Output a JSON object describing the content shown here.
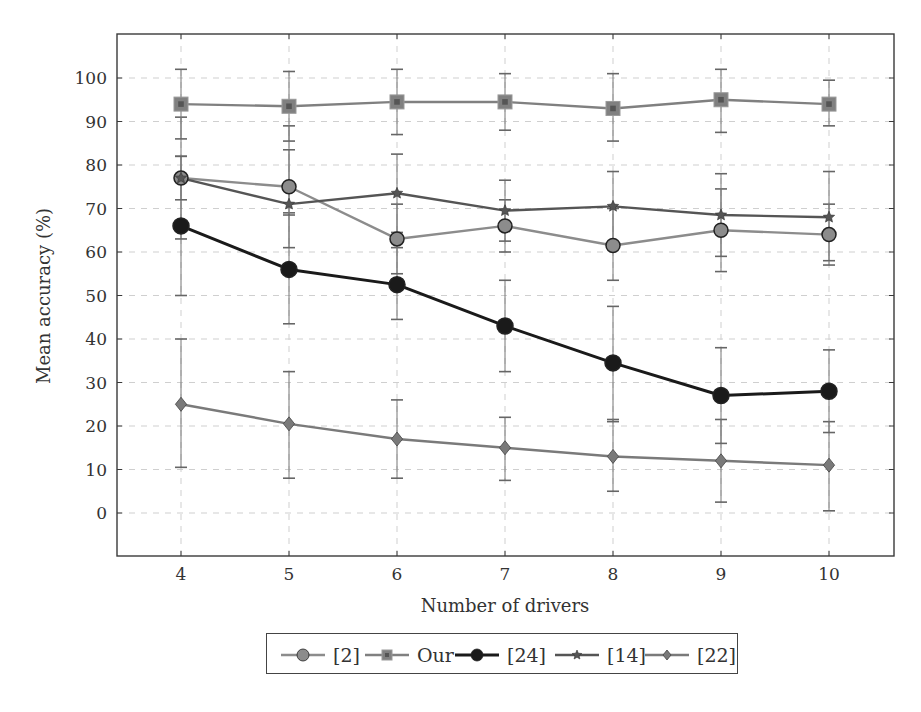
{
  "chart_data": {
    "type": "line",
    "title": "",
    "xlabel": "Number of drivers",
    "ylabel": "Mean accuracy (%)",
    "x": [
      4,
      5,
      6,
      7,
      8,
      9,
      10
    ],
    "xticks": [
      "4",
      "5",
      "6",
      "7",
      "8",
      "9",
      "10"
    ],
    "yticks": [
      "0",
      "10",
      "20",
      "30",
      "40",
      "50",
      "60",
      "70",
      "80",
      "90",
      "100"
    ],
    "xlim": [
      3.4,
      10.6
    ],
    "ylim": [
      -10,
      110
    ],
    "grid": "dashed",
    "legend_position": "bottom",
    "error_bars": true,
    "series": [
      {
        "name": "[2]",
        "marker": "circle",
        "color": "#8c8c8c",
        "line_width": 2.4,
        "values": [
          77,
          75,
          63,
          66,
          61.5,
          65,
          64
        ],
        "err_low": [
          63,
          61,
          55,
          60,
          53.5,
          55.5,
          57
        ],
        "err_high": [
          91,
          89,
          71,
          72,
          70,
          74.5,
          71
        ]
      },
      {
        "name": "Our",
        "marker": "square",
        "color": "#808080",
        "line_width": 2.4,
        "values": [
          94,
          93.5,
          94.5,
          94.5,
          93,
          95,
          94
        ],
        "err_low": [
          86,
          85.5,
          87,
          88,
          85.5,
          87.5,
          89
        ],
        "err_high": [
          102,
          101.5,
          102,
          101,
          101,
          102,
          99.5
        ]
      },
      {
        "name": "[24]",
        "marker": "circle",
        "color": "#1a1a1a",
        "line_width": 3,
        "values": [
          66,
          56,
          52.5,
          43,
          34.5,
          27,
          28
        ],
        "err_low": [
          50,
          43.5,
          44.5,
          32.5,
          21,
          16,
          18.5
        ],
        "err_high": [
          82,
          69,
          61,
          53.5,
          47.5,
          38,
          37.5
        ]
      },
      {
        "name": "[14]",
        "marker": "star",
        "color": "#555555",
        "line_width": 2.4,
        "values": [
          77,
          71,
          73.5,
          69.5,
          70.5,
          68.5,
          68
        ],
        "err_low": [
          72,
          68.5,
          64.5,
          62.5,
          62,
          59,
          58
        ],
        "err_high": [
          82,
          83.5,
          82.5,
          76.5,
          78.5,
          78,
          78.5
        ]
      },
      {
        "name": "[22]",
        "marker": "diamond",
        "color": "#7a7a7a",
        "line_width": 2.4,
        "values": [
          25,
          20.5,
          17,
          15,
          13,
          12,
          11
        ],
        "err_low": [
          10.5,
          8,
          8,
          7.5,
          5,
          2.5,
          0.5
        ],
        "err_high": [
          40,
          32.5,
          26,
          22,
          21.5,
          21.5,
          21
        ]
      }
    ]
  },
  "axes": {
    "xlabel": "Number of drivers",
    "ylabel": "Mean accuracy (%)"
  },
  "legend": {
    "items": [
      "[2]",
      "Our",
      "[24]",
      "[14]",
      "[22]"
    ]
  }
}
